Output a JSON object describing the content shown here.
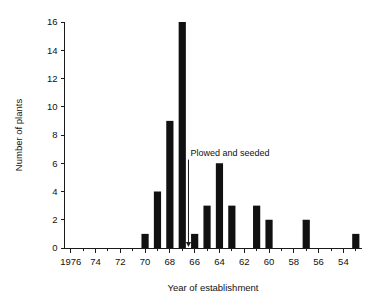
{
  "chart_data": {
    "type": "bar",
    "title": "",
    "xlabel": "Year of establishment",
    "ylabel": "Number of plants",
    "grid": false,
    "legend": "none",
    "orientation": "x-axis reversed (years descending left to right)",
    "xlim": [
      1976.5,
      1952.5
    ],
    "ylim": [
      0,
      16
    ],
    "yticks": [
      0,
      2,
      4,
      6,
      8,
      10,
      12,
      14,
      16
    ],
    "ytick_labels": [
      "0",
      "2",
      "4",
      "6",
      "8",
      "10",
      "12",
      "14",
      "16"
    ],
    "xticks": [
      1976,
      1974,
      1972,
      1970,
      1968,
      1966,
      1964,
      1962,
      1960,
      1958,
      1956,
      1954
    ],
    "xtick_labels": [
      "1976",
      "74",
      "72",
      "70",
      "68",
      "66",
      "64",
      "62",
      "60",
      "58",
      "56",
      "54"
    ],
    "minor_xtick_interval": 1,
    "categories": [
      1976,
      1975,
      1974,
      1973,
      1972,
      1971,
      1970,
      1969,
      1968,
      1967,
      1966,
      1965,
      1964,
      1963,
      1962,
      1961,
      1960,
      1959,
      1958,
      1957,
      1956,
      1955,
      1954,
      1953
    ],
    "values": [
      0,
      0,
      0,
      0,
      0,
      0,
      1,
      4,
      9,
      16,
      1,
      3,
      6,
      3,
      0,
      3,
      2,
      0,
      0,
      2,
      0,
      0,
      0,
      1
    ],
    "annotations": [
      {
        "text": "Plowed and seeded",
        "x": 1966.5,
        "y_text": 6.4,
        "arrow_to_y": 0,
        "style": "downward arrow"
      }
    ]
  },
  "axes": {
    "y_title": "Number of plants",
    "x_title": "Year of establishment"
  },
  "colors": {
    "bar": "#111111",
    "axis": "#1a1a1a",
    "text": "#111111",
    "background": "#ffffff"
  }
}
